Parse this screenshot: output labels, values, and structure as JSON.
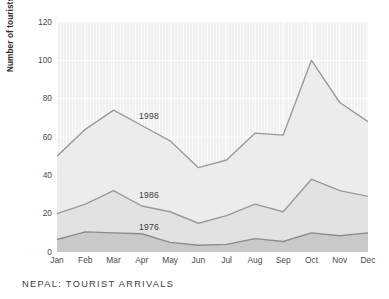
{
  "caption": "NEPAL: TOURIST ARRIVALS",
  "axis": {
    "ylabel": "Number of tourists (thousand)",
    "yticks": [
      "0",
      "20",
      "40",
      "60",
      "80",
      "100",
      "120"
    ],
    "xticks": [
      "Jan",
      "Feb",
      "Mar",
      "Apr",
      "May",
      "Jun",
      "Jul",
      "Aug",
      "Sep",
      "Oct",
      "Nov",
      "Dec"
    ]
  },
  "annotations": {
    "series_1998": "1998",
    "series_1986": "1986",
    "series_1976": "1976"
  },
  "colors": {
    "plot_background": "#f1f1f1",
    "gridline": "#ffffff",
    "line_1998": "#9a9a9a",
    "line_1986": "#9a9a9a",
    "line_1976": "#8c8c8c",
    "fill_1998": "#ececec",
    "fill_1986": "#e2e2e2",
    "fill_1976": "#c9c9c9",
    "text": "#4a4a4a"
  },
  "chart_data": {
    "type": "line",
    "title": "NEPAL: TOURIST ARRIVALS",
    "xlabel": "",
    "ylabel": "Number of tourists (thousand)",
    "ylim": [
      0,
      120
    ],
    "ytick_step": 20,
    "grid": true,
    "legend_position": "inline-annotations",
    "categories": [
      "Jan",
      "Feb",
      "Mar",
      "Apr",
      "May",
      "Jun",
      "Jul",
      "Aug",
      "Sep",
      "Oct",
      "Nov",
      "Dec"
    ],
    "series": [
      {
        "name": "1998",
        "values": [
          50,
          64,
          74,
          66,
          58,
          44,
          48,
          62,
          61,
          100,
          78,
          68
        ]
      },
      {
        "name": "1986",
        "values": [
          20,
          25,
          32,
          24,
          21,
          15,
          19,
          25,
          21,
          38,
          32,
          29
        ]
      },
      {
        "name": "1976",
        "values": [
          6.5,
          10.5,
          10,
          9.5,
          5,
          3.5,
          4,
          7,
          5.5,
          10,
          8.5,
          10
        ]
      }
    ]
  }
}
